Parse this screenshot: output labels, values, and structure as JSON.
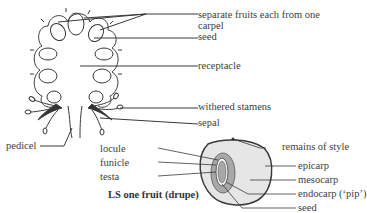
{
  "diagram": {
    "title": "LS one fruit (drupe)",
    "whole_fruit_labels": {
      "separate_fruits": "separate fruits each from one carpel",
      "separate_fruits_line1": "separate fruits each from one",
      "separate_fruits_line2": "carpel",
      "seed": "seed",
      "receptacle": "receptacle",
      "withered_stamens": "withered stamens",
      "sepal": "sepal",
      "pedicel": "pedicel"
    },
    "drupe_labels": {
      "locule": "locule",
      "funicle": "funicle",
      "testa": "testa",
      "remains_of_style": "remains of style",
      "epicarp": "epicarp",
      "mesocarp": "mesocarp",
      "endocarp": "endocarp (‘pip’)",
      "seed": "seed"
    },
    "colors": {
      "line": "#3a3a3a",
      "mesocarp_fill": "#e6e6e6",
      "endocarp_fill": "#a8a8a8",
      "seed_fill": "#ffffff"
    }
  }
}
